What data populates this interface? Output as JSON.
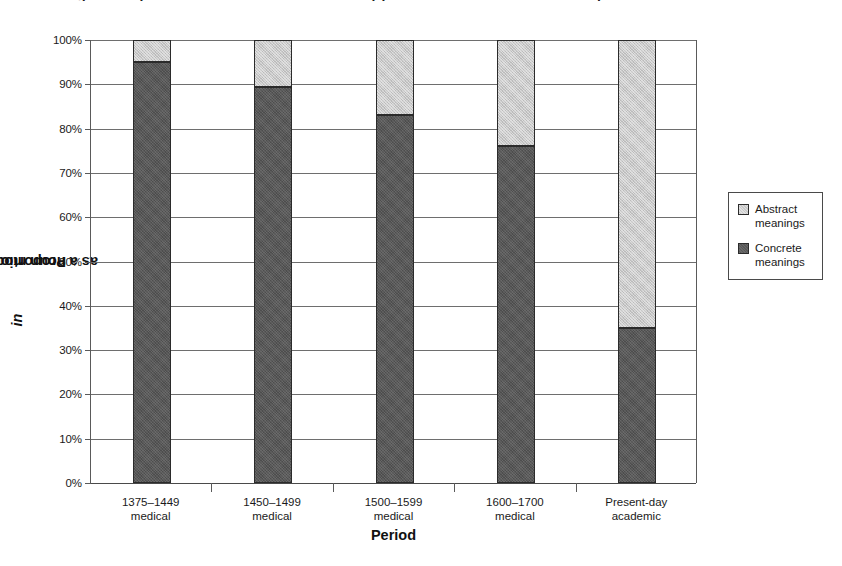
{
  "clipped_title": "Figure: Proportions of in as a noun modifier by period in medical and academic prose",
  "chart_data": {
    "type": "bar",
    "subtype": "stacked-100-percent",
    "title": "",
    "xlabel": "Period",
    "ylabel": "Proportion of in as a noun modifier",
    "ylabel_italic_word": "in",
    "ylim": [
      0,
      100
    ],
    "ytick_labels": [
      "0%",
      "10%",
      "20%",
      "30%",
      "40%",
      "50%",
      "60%",
      "70%",
      "80%",
      "90%",
      "100%"
    ],
    "ytick_values": [
      0,
      10,
      20,
      30,
      40,
      50,
      60,
      70,
      80,
      90,
      100
    ],
    "grid": true,
    "legend_position": "right",
    "categories": [
      {
        "line1": "1375–1449",
        "line2": "medical"
      },
      {
        "line1": "1450–1499",
        "line2": "medical"
      },
      {
        "line1": "1500–1599",
        "line2": "medical"
      },
      {
        "line1": "1600–1700",
        "line2": "medical"
      },
      {
        "line1": "Present-day",
        "line2": "academic"
      }
    ],
    "series": [
      {
        "name": "Concrete meanings",
        "legend_line1": "Concrete",
        "legend_line2": "meanings",
        "color": "#585858",
        "values": [
          95,
          89.5,
          83,
          76,
          35
        ]
      },
      {
        "name": "Abstract meanings",
        "legend_line1": "Abstract",
        "legend_line2": "meanings",
        "color": "#c9c9c9",
        "values": [
          5,
          10.5,
          17,
          24,
          65
        ]
      }
    ]
  }
}
